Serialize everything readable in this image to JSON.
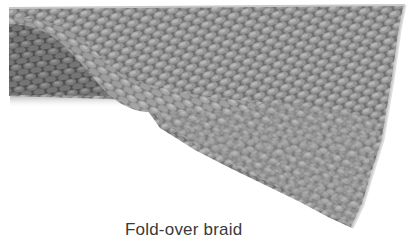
{
  "figure": {
    "caption": "Fold-over braid",
    "colors": {
      "background": "#ffffff",
      "braid_light": "#a8a8a8",
      "braid_mid": "#8a8a8a",
      "braid_dark": "#5e5e5e",
      "caption_text": "#3a3a3a"
    }
  }
}
